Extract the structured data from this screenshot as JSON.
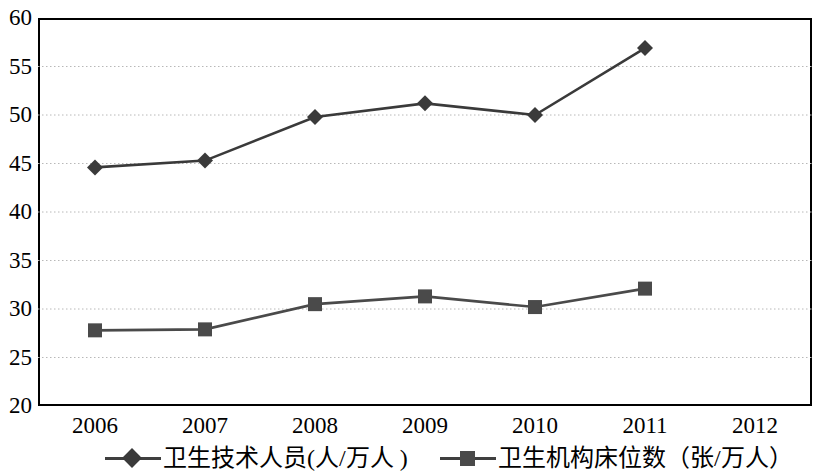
{
  "chart_data": {
    "type": "line",
    "title": "",
    "xlabel": "",
    "ylabel": "",
    "categories": [
      "2006",
      "2007",
      "2008",
      "2009",
      "2010",
      "2011",
      "2012"
    ],
    "x_tick_labels": [
      "2006",
      "2007",
      "2008",
      "2009",
      "2010",
      "2011",
      "2012"
    ],
    "y_tick_labels": [
      "20",
      "25",
      "30",
      "35",
      "40",
      "45",
      "50",
      "55",
      "60"
    ],
    "y_ticks": [
      20,
      25,
      30,
      35,
      40,
      45,
      50,
      55,
      60
    ],
    "ylim": [
      20,
      60
    ],
    "grid": "horizontal-dotted",
    "legend_position": "bottom",
    "series": [
      {
        "name": "卫生技术人员(人/万人 )",
        "marker": "diamond",
        "color": "#3a3a3a",
        "values": [
          44.6,
          45.3,
          49.8,
          51.2,
          50.0,
          56.9,
          null
        ]
      },
      {
        "name": "卫生机构床位数（张/万人）",
        "marker": "square",
        "color": "#4a4a4a",
        "values": [
          27.8,
          27.9,
          30.5,
          31.3,
          30.2,
          32.1,
          null
        ]
      }
    ]
  },
  "legend": {
    "entries": [
      {
        "label": "卫生技术人员(人/万人 )",
        "marker": "diamond-marker"
      },
      {
        "label": "卫生机构床位数（张/万人）",
        "marker": "square-marker"
      }
    ]
  },
  "colors": {
    "series_1": "#3a3a3a",
    "series_2": "#4a4a4a",
    "axis": "#000000",
    "gridline": "#b8b8b8",
    "background": "#ffffff"
  }
}
